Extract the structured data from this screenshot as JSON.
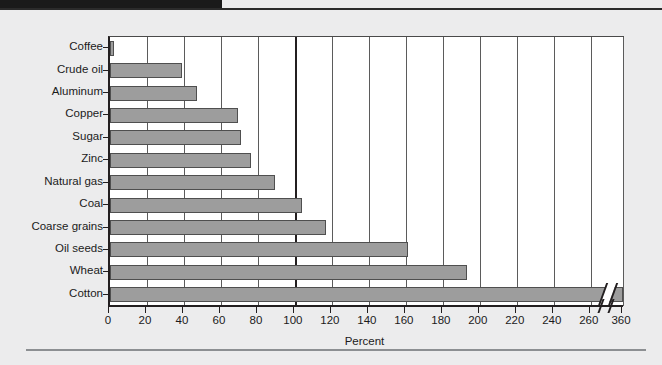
{
  "chart_data": {
    "type": "bar",
    "orientation": "horizontal",
    "title": "",
    "xlabel": "Percent",
    "ylabel": "",
    "xlim": [
      0,
      360
    ],
    "grid": true,
    "legend": null,
    "axis_break": {
      "from": 265,
      "to": 355,
      "tick_labels": [
        "260",
        "360"
      ]
    },
    "xticks": [
      0,
      20,
      40,
      60,
      80,
      100,
      120,
      140,
      160,
      180,
      200,
      220,
      240,
      260,
      360
    ],
    "xticklabels": [
      "0",
      "20",
      "40",
      "60",
      "80",
      "100",
      "120",
      "140",
      "160",
      "180",
      "200",
      "220",
      "240",
      "260",
      "360"
    ],
    "categories": [
      "Coffee",
      "Crude oil",
      "Aluminum",
      "Copper",
      "Sugar",
      "Zinc",
      "Natural gas",
      "Coal",
      "Coarse grains",
      "Oil seeds",
      "Wheat",
      "Cotton"
    ],
    "values": [
      2,
      39,
      47,
      69,
      71,
      76,
      89,
      104,
      117,
      161,
      193,
      360
    ],
    "bar_color": "#9d9d9d",
    "bar_edge_color": "#4f4f4f",
    "plot_background": "#ffffff",
    "figure_background": "#ececed",
    "gridline_color": "#5b5b5b",
    "axis_color": "#231f20"
  }
}
